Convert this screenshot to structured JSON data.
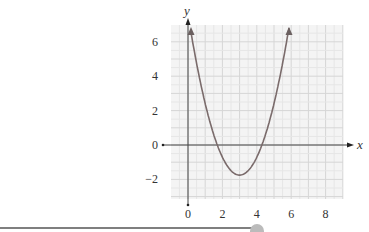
{
  "chart_data": {
    "type": "line",
    "title": "",
    "xlabel": "x",
    "ylabel": "y",
    "xlim": [
      -1,
      9
    ],
    "ylim": [
      -3.2,
      7
    ],
    "grid": true,
    "x_ticks": [
      "0",
      "2",
      "4",
      "6",
      "8"
    ],
    "y_ticks": [
      "6",
      "4",
      "2",
      "0",
      "−2"
    ],
    "series": [
      {
        "name": "parabola",
        "equation_approx": "y = (x - 3)^2 - 1.75",
        "x": [
          0.17,
          1,
          1.7,
          2,
          3,
          4,
          4.3,
          5,
          5.87
        ],
        "y": [
          6.8,
          2.25,
          0,
          -0.75,
          -1.75,
          -0.75,
          0,
          2.25,
          6.8
        ],
        "vertex": [
          3,
          -1.75
        ],
        "roots": [
          1.7,
          4.3
        ],
        "arrows_at_ends": true
      }
    ]
  },
  "axes": {
    "x_label": "x",
    "y_label": "y",
    "x_tick_labels": [
      "0",
      "2",
      "4",
      "6",
      "8"
    ],
    "y_tick_labels": [
      "6",
      "4",
      "2",
      "0",
      "−2"
    ]
  },
  "slider": {
    "progress_percent": 70
  }
}
